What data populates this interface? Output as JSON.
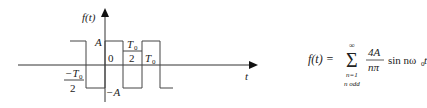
{
  "diagram": {
    "type": "square-wave",
    "axis": {
      "y_label": "f(t)",
      "x_label": "t"
    },
    "levels": {
      "high_label": "A",
      "low_label": "−A"
    },
    "ticks": {
      "origin": "0",
      "neg_half_period_num": "−T",
      "neg_half_period_sub": "0",
      "neg_half_period_den": "2",
      "half_period_num": "T",
      "half_period_sub": "0",
      "half_period_den": "2",
      "period": "T",
      "period_sub": "0"
    }
  },
  "formula": {
    "lhs": "f(t) =",
    "sum_upper": "∞",
    "sum_symbol": "Σ",
    "sum_lower": "n=1",
    "sum_condition": "n odd",
    "frac_num": "4A",
    "frac_den": "nπ",
    "trail": "sin nω",
    "trail_sub": "0",
    "trail_end": "t"
  }
}
